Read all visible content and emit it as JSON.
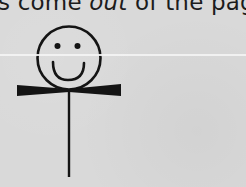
{
  "caption": {
    "prefix": "s come ",
    "emphasis": "out",
    "suffix": " of the page."
  },
  "figure": {
    "icon": "smiley-stick-figure-icon",
    "stroke_color": "#141414",
    "background_color": "#d9d9d9"
  }
}
